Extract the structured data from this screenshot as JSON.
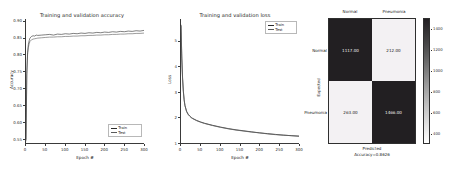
{
  "figure": {
    "background": "#ffffff",
    "panels": [
      "accuracy",
      "loss",
      "confusion_matrix"
    ]
  },
  "accuracy_panel": {
    "title": "Training and validation accuracy",
    "xlabel": "Epoch #",
    "ylabel": "Accuracy",
    "yticks": [
      "0.90",
      "0.85",
      "0.80",
      "0.75",
      "0.70",
      "0.65",
      "0.60",
      "0.55"
    ],
    "xticks": [
      "0",
      "50",
      "100",
      "150",
      "200",
      "250",
      "300"
    ],
    "legend": [
      {
        "label": "Train",
        "color": "#2a2a2a"
      },
      {
        "label": "Test",
        "color": "#5a5a5a"
      }
    ]
  },
  "loss_panel": {
    "title": "Training and validation loss",
    "xlabel": "Epoch #",
    "ylabel": "Loss",
    "yticks": [
      "5",
      "4",
      "3",
      "2",
      "1"
    ],
    "xticks": [
      "0",
      "50",
      "100",
      "150",
      "200",
      "250",
      "300"
    ],
    "legend": [
      {
        "label": "Train",
        "color": "#2a2a2a"
      },
      {
        "label": "Test",
        "color": "#5a5a5a"
      }
    ]
  },
  "confusion_matrix_panel": {
    "col_labels": [
      "Normal",
      "Pneumonia"
    ],
    "row_labels": [
      "Normal",
      "Pneumonia"
    ],
    "ylabel": "Expected",
    "xlabel": "Predicted",
    "accuracy_caption": "Accuracy=0.8626",
    "cells": [
      {
        "value": "1117.00",
        "shade": "dark"
      },
      {
        "value": "212.00",
        "shade": "light"
      },
      {
        "value": "263.00",
        "shade": "light"
      },
      {
        "value": "1466.00",
        "shade": "dark"
      }
    ],
    "colorbar_ticks": [
      "1400",
      "1200",
      "1000",
      "800",
      "600",
      "400"
    ]
  },
  "chart_data": [
    {
      "type": "line",
      "title": "Training and validation accuracy",
      "xlabel": "Epoch #",
      "ylabel": "Accuracy",
      "xlim": [
        0,
        300
      ],
      "ylim": [
        0.535,
        0.905
      ],
      "ytick_values": [
        0.55,
        0.6,
        0.65,
        0.7,
        0.75,
        0.8,
        0.85,
        0.9
      ],
      "xtick_values": [
        0,
        50,
        100,
        150,
        200,
        250,
        300
      ],
      "grid": false,
      "legend_position": "lower right",
      "series": [
        {
          "name": "Train",
          "color": "#2a2a2a",
          "x": [
            0,
            2,
            4,
            6,
            8,
            10,
            14,
            18,
            22,
            26,
            30,
            40,
            50,
            60,
            70,
            80,
            90,
            100,
            110,
            120,
            130,
            140,
            150,
            160,
            170,
            180,
            190,
            200,
            210,
            220,
            230,
            240,
            250,
            260,
            270,
            280,
            290,
            300
          ],
          "values": [
            0.545,
            0.742,
            0.806,
            0.829,
            0.84,
            0.848,
            0.853,
            0.855,
            0.854,
            0.857,
            0.856,
            0.857,
            0.858,
            0.859,
            0.857,
            0.86,
            0.859,
            0.861,
            0.86,
            0.862,
            0.861,
            0.863,
            0.862,
            0.864,
            0.863,
            0.865,
            0.864,
            0.866,
            0.865,
            0.867,
            0.866,
            0.868,
            0.867,
            0.869,
            0.868,
            0.87,
            0.869,
            0.871
          ]
        },
        {
          "name": "Test",
          "color": "#5a5a5a",
          "x": [
            0,
            2,
            4,
            6,
            8,
            10,
            14,
            18,
            22,
            26,
            30,
            40,
            50,
            60,
            70,
            80,
            90,
            100,
            110,
            120,
            130,
            140,
            150,
            160,
            170,
            180,
            190,
            200,
            210,
            220,
            230,
            240,
            250,
            260,
            270,
            280,
            290,
            300
          ],
          "values": [
            0.54,
            0.735,
            0.798,
            0.82,
            0.831,
            0.838,
            0.843,
            0.845,
            0.846,
            0.847,
            0.848,
            0.849,
            0.85,
            0.851,
            0.851,
            0.852,
            0.852,
            0.853,
            0.853,
            0.854,
            0.854,
            0.855,
            0.855,
            0.856,
            0.856,
            0.857,
            0.857,
            0.858,
            0.858,
            0.859,
            0.859,
            0.86,
            0.86,
            0.861,
            0.861,
            0.862,
            0.862,
            0.863
          ]
        }
      ]
    },
    {
      "type": "line",
      "title": "Training and validation loss",
      "xlabel": "Epoch #",
      "ylabel": "Loss",
      "xlim": [
        0,
        300
      ],
      "ylim": [
        0.95,
        5.85
      ],
      "ytick_values": [
        1,
        2,
        3,
        4,
        5
      ],
      "xtick_values": [
        0,
        50,
        100,
        150,
        200,
        250,
        300
      ],
      "grid": false,
      "legend_position": "upper right",
      "series": [
        {
          "name": "Train",
          "color": "#2a2a2a",
          "x": [
            0,
            2,
            4,
            6,
            8,
            10,
            14,
            18,
            22,
            26,
            30,
            40,
            50,
            60,
            80,
            100,
            120,
            140,
            160,
            180,
            200,
            220,
            240,
            260,
            280,
            300
          ],
          "values": [
            5.62,
            4.35,
            3.52,
            3.0,
            2.66,
            2.44,
            2.21,
            2.09,
            2.02,
            1.96,
            1.92,
            1.84,
            1.78,
            1.73,
            1.65,
            1.58,
            1.52,
            1.47,
            1.43,
            1.39,
            1.35,
            1.32,
            1.29,
            1.26,
            1.24,
            1.22
          ]
        },
        {
          "name": "Test",
          "color": "#5a5a5a",
          "x": [
            0,
            2,
            4,
            6,
            8,
            10,
            14,
            18,
            22,
            26,
            30,
            40,
            50,
            60,
            80,
            100,
            120,
            140,
            160,
            180,
            200,
            220,
            240,
            260,
            280,
            300
          ],
          "values": [
            5.58,
            4.3,
            3.48,
            2.97,
            2.64,
            2.43,
            2.2,
            2.08,
            2.01,
            1.95,
            1.91,
            1.83,
            1.77,
            1.72,
            1.64,
            1.57,
            1.51,
            1.46,
            1.42,
            1.38,
            1.35,
            1.31,
            1.28,
            1.26,
            1.24,
            1.22
          ]
        }
      ]
    },
    {
      "type": "heatmap",
      "title": "",
      "xlabel": "Predicted",
      "ylabel": "Expected",
      "annotation": "Accuracy=0.8626",
      "x_categories": [
        "Normal",
        "Pneumonia"
      ],
      "y_categories": [
        "Normal",
        "Pneumonia"
      ],
      "values": [
        [
          1117.0,
          212.0
        ],
        [
          263.0,
          1466.0
        ]
      ],
      "colorbar_ticks": [
        400,
        600,
        800,
        1000,
        1200,
        1400
      ],
      "colormap": "gray_r"
    }
  ]
}
